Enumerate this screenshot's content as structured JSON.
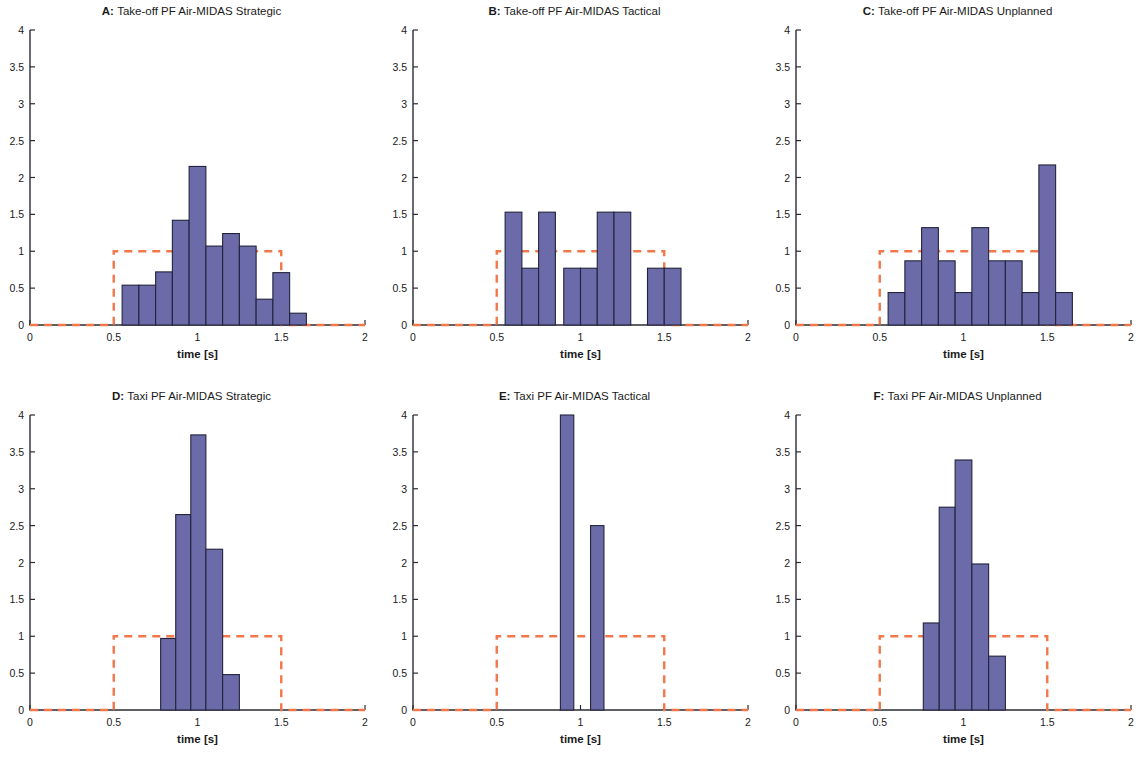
{
  "figure": {
    "axis_label_x": "time [s]",
    "colors": {
      "bar_fill": "#6B6BAA",
      "bar_edge": "#23233C",
      "reference_line": "#F2784B",
      "axis": "#2B2B35",
      "background": "#FFFFFF"
    }
  },
  "chart_data": [
    {
      "type": "bar",
      "panel": "A",
      "panel_label": "A:",
      "title": "Take-off PF Air-MIDAS Strategic",
      "xlabel": "time [s]",
      "ylabel": "",
      "xlim": [
        0,
        2
      ],
      "ylim": [
        0,
        4
      ],
      "xticks": [
        0,
        0.5,
        1,
        1.5,
        2
      ],
      "xticklabels": [
        "0",
        "0.5",
        "1",
        "1.5",
        "2"
      ],
      "yticks": [
        0,
        0.5,
        1,
        1.5,
        2,
        2.5,
        3,
        3.5,
        4
      ],
      "yticklabels": [
        "0",
        "0.5",
        "1",
        "1.5",
        "2",
        "2.5",
        "3",
        "3.5",
        "4"
      ],
      "grid": false,
      "legend": "none",
      "bins": [
        {
          "x0": 0.55,
          "x1": 0.65,
          "value": 0.54
        },
        {
          "x0": 0.65,
          "x1": 0.75,
          "value": 0.54
        },
        {
          "x0": 0.75,
          "x1": 0.85,
          "value": 0.72
        },
        {
          "x0": 0.85,
          "x1": 0.95,
          "value": 1.42
        },
        {
          "x0": 0.95,
          "x1": 1.05,
          "value": 2.15
        },
        {
          "x0": 1.05,
          "x1": 1.15,
          "value": 1.07
        },
        {
          "x0": 1.15,
          "x1": 1.25,
          "value": 1.24
        },
        {
          "x0": 1.25,
          "x1": 1.35,
          "value": 1.07
        },
        {
          "x0": 1.35,
          "x1": 1.45,
          "value": 0.35
        },
        {
          "x0": 1.45,
          "x1": 1.55,
          "value": 0.71
        },
        {
          "x0": 1.55,
          "x1": 1.65,
          "value": 0.16
        }
      ],
      "reference_box": {
        "x_start": 0.5,
        "x_end": 1.5,
        "height": 1,
        "style": "dashed"
      }
    },
    {
      "type": "bar",
      "panel": "B",
      "panel_label": "B:",
      "title": "Take-off PF Air-MIDAS Tactical",
      "xlabel": "time [s]",
      "ylabel": "",
      "xlim": [
        0,
        2
      ],
      "ylim": [
        0,
        4
      ],
      "xticks": [
        0,
        0.5,
        1,
        1.5,
        2
      ],
      "xticklabels": [
        "0",
        "0.5",
        "1",
        "1.5",
        "2"
      ],
      "yticks": [
        0,
        0.5,
        1,
        1.5,
        2,
        2.5,
        3,
        3.5,
        4
      ],
      "yticklabels": [
        "0",
        "0.5",
        "1",
        "1.5",
        "2",
        "2.5",
        "3",
        "3.5",
        "4"
      ],
      "grid": false,
      "legend": "none",
      "bins": [
        {
          "x0": 0.55,
          "x1": 0.65,
          "value": 1.53
        },
        {
          "x0": 0.65,
          "x1": 0.75,
          "value": 0.77
        },
        {
          "x0": 0.75,
          "x1": 0.85,
          "value": 1.53
        },
        {
          "x0": 0.9,
          "x1": 1.0,
          "value": 0.77
        },
        {
          "x0": 1.0,
          "x1": 1.1,
          "value": 0.77
        },
        {
          "x0": 1.1,
          "x1": 1.2,
          "value": 1.53
        },
        {
          "x0": 1.2,
          "x1": 1.3,
          "value": 1.53
        },
        {
          "x0": 1.4,
          "x1": 1.5,
          "value": 0.77
        },
        {
          "x0": 1.5,
          "x1": 1.6,
          "value": 0.77
        }
      ],
      "reference_box": {
        "x_start": 0.5,
        "x_end": 1.5,
        "height": 1,
        "style": "dashed"
      }
    },
    {
      "type": "bar",
      "panel": "C",
      "panel_label": "C:",
      "title": "Take-off PF Air-MIDAS Unplanned",
      "xlabel": "time [s]",
      "ylabel": "",
      "xlim": [
        0,
        2
      ],
      "ylim": [
        0,
        4
      ],
      "xticks": [
        0,
        0.5,
        1,
        1.5,
        2
      ],
      "xticklabels": [
        "0",
        "0.5",
        "1",
        "1.5",
        "2"
      ],
      "yticks": [
        0,
        0.5,
        1,
        1.5,
        2,
        2.5,
        3,
        3.5,
        4
      ],
      "yticklabels": [
        "0",
        "0.5",
        "1",
        "1.5",
        "2",
        "2.5",
        "3",
        "3.5",
        "4"
      ],
      "grid": false,
      "legend": "none",
      "bins": [
        {
          "x0": 0.55,
          "x1": 0.65,
          "value": 0.44
        },
        {
          "x0": 0.65,
          "x1": 0.75,
          "value": 0.87
        },
        {
          "x0": 0.75,
          "x1": 0.85,
          "value": 1.32
        },
        {
          "x0": 0.85,
          "x1": 0.95,
          "value": 0.87
        },
        {
          "x0": 0.95,
          "x1": 1.05,
          "value": 0.44
        },
        {
          "x0": 1.05,
          "x1": 1.15,
          "value": 1.32
        },
        {
          "x0": 1.15,
          "x1": 1.25,
          "value": 0.87
        },
        {
          "x0": 1.25,
          "x1": 1.35,
          "value": 0.87
        },
        {
          "x0": 1.35,
          "x1": 1.45,
          "value": 0.44
        },
        {
          "x0": 1.45,
          "x1": 1.55,
          "value": 2.17
        },
        {
          "x0": 1.55,
          "x1": 1.65,
          "value": 0.44
        }
      ],
      "reference_box": {
        "x_start": 0.5,
        "x_end": 1.5,
        "height": 1,
        "style": "dashed"
      }
    },
    {
      "type": "bar",
      "panel": "D",
      "panel_label": "D:",
      "title": "Taxi PF Air-MIDAS Strategic",
      "xlabel": "time [s]",
      "ylabel": "",
      "xlim": [
        0,
        2
      ],
      "ylim": [
        0,
        4
      ],
      "xticks": [
        0,
        0.5,
        1,
        1.5,
        2
      ],
      "xticklabels": [
        "0",
        "0.5",
        "1",
        "1.5",
        "2"
      ],
      "yticks": [
        0,
        0.5,
        1,
        1.5,
        2,
        2.5,
        3,
        3.5,
        4
      ],
      "yticklabels": [
        "0",
        "0.5",
        "1",
        "1.5",
        "2",
        "2.5",
        "3",
        "3.5",
        "4"
      ],
      "grid": false,
      "legend": "none",
      "bins": [
        {
          "x0": 0.78,
          "x1": 0.87,
          "value": 0.97
        },
        {
          "x0": 0.87,
          "x1": 0.96,
          "value": 2.65
        },
        {
          "x0": 0.96,
          "x1": 1.05,
          "value": 3.73
        },
        {
          "x0": 1.05,
          "x1": 1.15,
          "value": 2.18
        },
        {
          "x0": 1.15,
          "x1": 1.25,
          "value": 0.48
        }
      ],
      "reference_box": {
        "x_start": 0.5,
        "x_end": 1.5,
        "height": 1,
        "style": "dashed"
      }
    },
    {
      "type": "bar",
      "panel": "E",
      "panel_label": "E:",
      "title": "Taxi PF Air-MIDAS Tactical",
      "xlabel": "time [s]",
      "ylabel": "",
      "xlim": [
        0,
        2
      ],
      "ylim": [
        0,
        4
      ],
      "xticks": [
        0,
        0.5,
        1,
        1.5,
        2
      ],
      "xticklabels": [
        "0",
        "0.5",
        "1",
        "1.5",
        "2"
      ],
      "yticks": [
        0,
        0.5,
        1,
        1.5,
        2,
        2.5,
        3,
        3.5,
        4
      ],
      "yticklabels": [
        "0",
        "0.5",
        "1",
        "1.5",
        "2",
        "2.5",
        "3",
        "3.5",
        "4"
      ],
      "grid": false,
      "legend": "none",
      "bins": [
        {
          "x0": 0.88,
          "x1": 0.96,
          "value": 4.0
        },
        {
          "x0": 1.06,
          "x1": 1.14,
          "value": 2.5
        }
      ],
      "reference_box": {
        "x_start": 0.5,
        "x_end": 1.5,
        "height": 1,
        "style": "dashed"
      }
    },
    {
      "type": "bar",
      "panel": "F",
      "panel_label": "F:",
      "title": "Taxi PF Air-MIDAS Unplanned",
      "xlabel": "time [s]",
      "ylabel": "",
      "xlim": [
        0,
        2
      ],
      "ylim": [
        0,
        4
      ],
      "xticks": [
        0,
        0.5,
        1,
        1.5,
        2
      ],
      "xticklabels": [
        "0",
        "0.5",
        "1",
        "1.5",
        "2"
      ],
      "yticks": [
        0,
        0.5,
        1,
        1.5,
        2,
        2.5,
        3,
        3.5,
        4
      ],
      "yticklabels": [
        "0",
        "0.5",
        "1",
        "1.5",
        "2",
        "2.5",
        "3",
        "3.5",
        "4"
      ],
      "grid": false,
      "legend": "none",
      "bins": [
        {
          "x0": 0.76,
          "x1": 0.855,
          "value": 1.18
        },
        {
          "x0": 0.855,
          "x1": 0.95,
          "value": 2.75
        },
        {
          "x0": 0.95,
          "x1": 1.05,
          "value": 3.39
        },
        {
          "x0": 1.05,
          "x1": 1.15,
          "value": 1.98
        },
        {
          "x0": 1.15,
          "x1": 1.25,
          "value": 0.73
        }
      ],
      "reference_box": {
        "x_start": 0.5,
        "x_end": 1.5,
        "height": 1,
        "style": "dashed"
      }
    }
  ]
}
